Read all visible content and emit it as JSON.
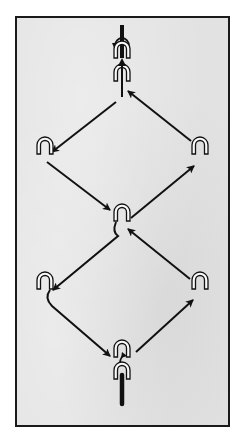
{
  "diagram": {
    "type": "flow-diagram",
    "background_color": "#e2e2e2",
    "border_color": "#1a1a1a",
    "stroke_color": "#111111",
    "nodes": [
      {
        "id": "top-stack",
        "icon": "double-arch-with-rotation-arrow",
        "x": 122,
        "y": 52
      },
      {
        "id": "upper-left",
        "icon": "arch",
        "x": 45,
        "y": 148
      },
      {
        "id": "upper-right",
        "icon": "arch",
        "x": 200,
        "y": 148
      },
      {
        "id": "center",
        "icon": "arch",
        "x": 122,
        "y": 215
      },
      {
        "id": "lower-left",
        "icon": "arch",
        "x": 45,
        "y": 283
      },
      {
        "id": "lower-right",
        "icon": "arch",
        "x": 200,
        "y": 283
      },
      {
        "id": "bottom-stack",
        "icon": "double-arch-with-bar",
        "x": 122,
        "y": 370
      }
    ],
    "edges": [
      {
        "from": "bottom-stack",
        "to": "lower-right"
      },
      {
        "from": "lower-right",
        "to": "center"
      },
      {
        "from": "center",
        "to": "lower-left"
      },
      {
        "from": "lower-left",
        "to": "bottom-stack"
      },
      {
        "from": "center",
        "to": "upper-right"
      },
      {
        "from": "upper-right",
        "to": "top-stack"
      },
      {
        "from": "top-stack",
        "to": "upper-left"
      },
      {
        "from": "upper-left",
        "to": "center"
      }
    ]
  }
}
